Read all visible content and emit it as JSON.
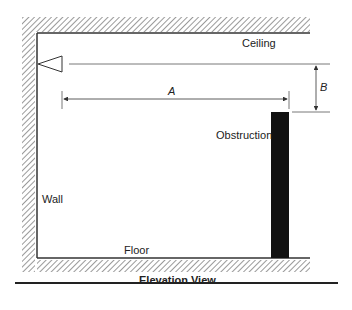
{
  "diagram": {
    "caption": "Elevation View",
    "labels": {
      "ceiling": "Ceiling",
      "wall": "Wall",
      "floor": "Floor",
      "obstruction": "Obstruction",
      "dim_a": "A",
      "dim_b": "B"
    },
    "colors": {
      "line": "#333333",
      "obstruction": "#111111",
      "hatch": "#555555"
    }
  }
}
